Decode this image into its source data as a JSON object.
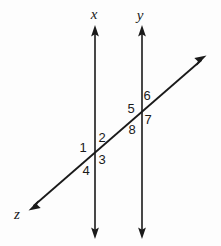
{
  "figure": {
    "background_color": "#fdfdfd",
    "ink_color": "#1a1a1a",
    "width": 221,
    "height": 246
  },
  "line_labels": [
    {
      "id": "line-label-x",
      "text": "x",
      "x": 94,
      "y": 14
    },
    {
      "id": "line-label-y",
      "text": "y",
      "x": 140,
      "y": 15
    },
    {
      "id": "line-label-z",
      "text": "z",
      "x": 17,
      "y": 214
    }
  ],
  "angle_labels": [
    {
      "id": "angle-label-1",
      "text": "1",
      "x": 83,
      "y": 147
    },
    {
      "id": "angle-label-2",
      "text": "2",
      "x": 102,
      "y": 137
    },
    {
      "id": "angle-label-3",
      "text": "3",
      "x": 102,
      "y": 159
    },
    {
      "id": "angle-label-4",
      "text": "4",
      "x": 86,
      "y": 170
    },
    {
      "id": "angle-label-5",
      "text": "5",
      "x": 131,
      "y": 108
    },
    {
      "id": "angle-label-6",
      "text": "6",
      "x": 147,
      "y": 95
    },
    {
      "id": "angle-label-7",
      "text": "7",
      "x": 148,
      "y": 119
    },
    {
      "id": "angle-label-8",
      "text": "8",
      "x": 132,
      "y": 129
    }
  ],
  "geometry": {
    "line_x": {
      "name": "vertical-line-x",
      "x": 95,
      "y_top": 28,
      "y_bottom": 236,
      "stroke_width": 1.6
    },
    "line_y": {
      "name": "vertical-line-y",
      "x": 142,
      "y_top": 28,
      "y_bottom": 236,
      "stroke_width": 1.6
    },
    "transversal_z": {
      "name": "transversal-line-z",
      "x1": 30,
      "y1": 209,
      "x2": 205,
      "y2": 57,
      "stroke_width": 1.8
    },
    "intersections": [
      {
        "name": "intersection-x-z",
        "x": 95,
        "y": 153
      },
      {
        "name": "intersection-y-z",
        "x": 142,
        "y": 112
      }
    ]
  }
}
